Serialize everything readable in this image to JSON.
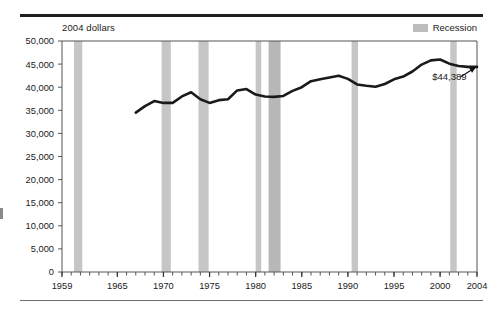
{
  "figure": {
    "axis_title": "2004 dollars",
    "legend": [
      {
        "label": "Recession",
        "swatch_color": "#bdbdbd",
        "name": "recession"
      }
    ]
  },
  "chart_data": {
    "type": "line",
    "title": "",
    "subtitle": "",
    "xlabel": "",
    "ylabel": "2004 dollars",
    "xlim": [
      1959,
      2004
    ],
    "ylim": [
      0,
      50000
    ],
    "grid": false,
    "legend_position": "top-right",
    "x_ticks_major": [
      1959,
      1965,
      1970,
      1975,
      1980,
      1985,
      1990,
      1995,
      2000,
      2004
    ],
    "x_tick_labels": [
      "1959",
      "1965",
      "1970",
      "1975",
      "1980",
      "1985",
      "1990",
      "1995",
      "2000",
      "2004"
    ],
    "x_minor_tick_step": 1,
    "y_ticks": [
      0,
      5000,
      10000,
      15000,
      20000,
      25000,
      30000,
      35000,
      40000,
      45000,
      50000
    ],
    "y_tick_labels": [
      "0",
      "5,000",
      "10,000",
      "15,000",
      "20,000",
      "25,000",
      "30,000",
      "35,000",
      "40,000",
      "45,000",
      "50,000"
    ],
    "series": [
      {
        "name": "Real median household income",
        "color": "#1a1a1a",
        "line_width": 2.6,
        "x": [
          1967,
          1968,
          1969,
          1970,
          1971,
          1972,
          1973,
          1974,
          1975,
          1976,
          1977,
          1978,
          1979,
          1980,
          1981,
          1982,
          1983,
          1984,
          1985,
          1986,
          1987,
          1988,
          1989,
          1990,
          1991,
          1992,
          1993,
          1994,
          1995,
          1996,
          1997,
          1998,
          1999,
          2000,
          2001,
          2002,
          2003,
          2004
        ],
        "values": [
          34500,
          35900,
          37000,
          36600,
          36600,
          38000,
          38900,
          37400,
          36600,
          37200,
          37400,
          39300,
          39600,
          38400,
          38000,
          37900,
          38100,
          39200,
          40000,
          41300,
          41700,
          42100,
          42500,
          41800,
          40600,
          40300,
          40100,
          40700,
          41700,
          42300,
          43400,
          44900,
          45800,
          46000,
          45100,
          44600,
          44400,
          44389
        ]
      }
    ],
    "shaded_bands": [
      {
        "label": "Recession",
        "x_start": 1960.3,
        "x_end": 1961.2,
        "color": "#c6c6c6"
      },
      {
        "label": "Recession",
        "x_start": 1969.8,
        "x_end": 1970.8,
        "color": "#c6c6c6"
      },
      {
        "label": "Recession",
        "x_start": 1973.8,
        "x_end": 1974.9,
        "color": "#c6c6c6"
      },
      {
        "label": "Recession",
        "x_start": 1980.0,
        "x_end": 1980.6,
        "color": "#c6c6c6"
      },
      {
        "label": "Recession",
        "x_start": 1981.4,
        "x_end": 1982.7,
        "color": "#b7b7b7"
      },
      {
        "label": "Recession",
        "x_start": 1990.4,
        "x_end": 1991.1,
        "color": "#c6c6c6"
      },
      {
        "label": "Recession",
        "x_start": 2001.1,
        "x_end": 2001.8,
        "color": "#c6c6c6"
      }
    ],
    "annotations": [
      {
        "text": "$44,389",
        "x": 2001.0,
        "y": 41600,
        "arrow_from_x": 2002.2,
        "arrow_from_y": 42200,
        "arrow_to_x": 2003.9,
        "arrow_to_y": 44389
      }
    ]
  }
}
